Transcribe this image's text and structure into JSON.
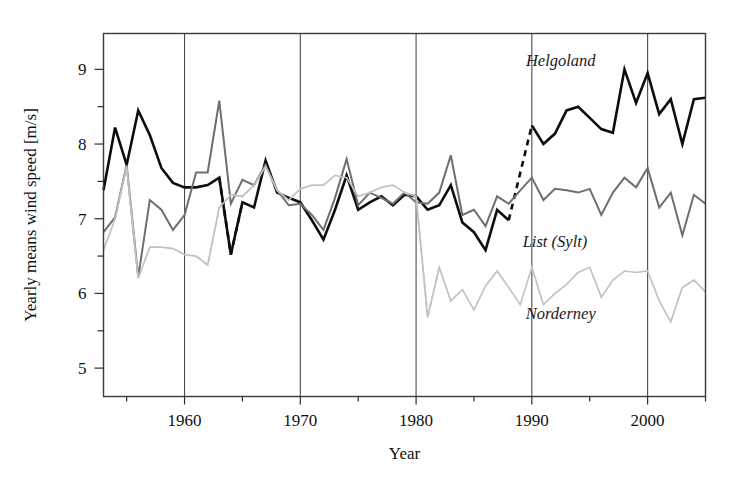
{
  "chart_data": {
    "type": "line",
    "title": "",
    "xlabel": "Year",
    "ylabel": "Yearly means wind speed [m/s]",
    "xlim": [
      1953,
      2005
    ],
    "ylim": [
      4.62,
      9.48
    ],
    "xticks": [
      1960,
      1970,
      1980,
      1990,
      2000
    ],
    "xtick_labels": [
      "1960",
      "1970",
      "1980",
      "1990",
      "2000"
    ],
    "xminor_ticks": [
      1955,
      1965,
      1975,
      1985,
      1995,
      2005
    ],
    "yticks": [
      5,
      6,
      7,
      8,
      9
    ],
    "ytick_labels": [
      "5",
      "6",
      "7",
      "8",
      "9"
    ],
    "yminor_ticks": [
      5.5,
      6.5,
      7.5,
      8.5
    ],
    "grid": "vertical-major-only",
    "legend": "inline-annotations",
    "annotations": [
      {
        "text": "Helgoland",
        "x": 1992.5,
        "y": 9.05,
        "name": "helgoland-label"
      },
      {
        "text": "List (Sylt)",
        "x": 1992.0,
        "y": 6.62,
        "name": "list-sylt-label"
      },
      {
        "text": "Norderney",
        "x": 1992.5,
        "y": 5.66,
        "name": "norderney-label"
      }
    ],
    "series": [
      {
        "name": "Helgoland",
        "color": "#0d0d0d",
        "width": 2.6,
        "x": [
          1953,
          1954,
          1955,
          1956,
          1957,
          1958,
          1959,
          1960,
          1961,
          1962,
          1963,
          1964,
          1965,
          1966,
          1967,
          1968,
          1969,
          1970,
          1971,
          1972,
          1973,
          1974,
          1975,
          1976,
          1977,
          1978,
          1979,
          1980,
          1981,
          1982,
          1983,
          1984,
          1985,
          1986,
          1987,
          1988,
          1990,
          1991,
          1992,
          1993,
          1994,
          1995,
          1996,
          1997,
          1998,
          1999,
          2000,
          2001,
          2002,
          2003,
          2004,
          2005
        ],
        "values": [
          7.38,
          8.22,
          7.72,
          8.45,
          8.12,
          7.68,
          7.48,
          7.42,
          7.42,
          7.45,
          7.55,
          6.52,
          7.22,
          7.15,
          7.78,
          7.35,
          7.28,
          7.22,
          6.98,
          6.72,
          7.12,
          7.58,
          7.12,
          7.22,
          7.3,
          7.18,
          7.32,
          7.3,
          7.12,
          7.18,
          7.45,
          6.95,
          6.82,
          6.58,
          7.12,
          6.98,
          8.25,
          8.0,
          8.14,
          8.45,
          8.5,
          8.35,
          8.2,
          8.15,
          9.0,
          8.55,
          8.95,
          8.4,
          8.6,
          8.0,
          8.6,
          8.62
        ],
        "gap_dashed_segment": {
          "from_year": 1988,
          "from_value": 6.98,
          "to_year": 1990,
          "to_value": 8.25
        },
        "dashed_segments": [
          {
            "x": [
              1963,
              1964,
              1965
            ],
            "values": [
              7.55,
              6.52,
              7.22
            ]
          }
        ]
      },
      {
        "name": "List (Sylt)",
        "color": "#6e6e6e",
        "width": 2.0,
        "x": [
          1953,
          1954,
          1955,
          1956,
          1957,
          1958,
          1959,
          1960,
          1961,
          1962,
          1963,
          1964,
          1965,
          1966,
          1967,
          1968,
          1969,
          1970,
          1971,
          1972,
          1973,
          1974,
          1975,
          1976,
          1977,
          1978,
          1979,
          1980,
          1981,
          1982,
          1983,
          1984,
          1985,
          1986,
          1987,
          1988,
          1989,
          1990,
          1991,
          1992,
          1993,
          1994,
          1995,
          1996,
          1997,
          1998,
          1999,
          2000,
          2001,
          2002,
          2003,
          2004,
          2005
        ],
        "values": [
          6.82,
          7.02,
          7.72,
          6.22,
          7.25,
          7.12,
          6.85,
          7.05,
          7.62,
          7.62,
          8.58,
          7.2,
          7.52,
          7.45,
          7.72,
          7.38,
          7.18,
          7.2,
          7.05,
          6.85,
          7.28,
          7.8,
          7.18,
          7.35,
          7.28,
          7.2,
          7.35,
          7.22,
          7.2,
          7.35,
          7.85,
          7.05,
          7.12,
          6.9,
          7.3,
          7.2,
          7.38,
          7.55,
          7.25,
          7.4,
          7.38,
          7.35,
          7.4,
          7.05,
          7.35,
          7.55,
          7.42,
          7.68,
          7.15,
          7.35,
          6.78,
          7.32,
          7.2
        ]
      },
      {
        "name": "Norderney",
        "color": "#c2c2c2",
        "width": 1.7,
        "x": [
          1953,
          1954,
          1955,
          1956,
          1957,
          1958,
          1959,
          1960,
          1961,
          1962,
          1963,
          1964,
          1965,
          1966,
          1967,
          1968,
          1969,
          1970,
          1971,
          1972,
          1973,
          1974,
          1975,
          1976,
          1977,
          1978,
          1979,
          1980,
          1981,
          1982,
          1983,
          1984,
          1985,
          1986,
          1987,
          1988,
          1989,
          1990,
          1991,
          1992,
          1993,
          1994,
          1995,
          1996,
          1997,
          1998,
          1999,
          2000,
          2001,
          2002,
          2003,
          2004,
          2005
        ],
        "values": [
          6.58,
          7.0,
          7.7,
          6.2,
          6.62,
          6.62,
          6.6,
          6.52,
          6.5,
          6.38,
          7.15,
          7.32,
          7.3,
          7.45,
          7.7,
          7.38,
          7.25,
          7.4,
          7.45,
          7.45,
          7.58,
          7.55,
          7.3,
          7.35,
          7.42,
          7.45,
          7.35,
          7.3,
          5.68,
          6.35,
          5.9,
          6.05,
          5.78,
          6.1,
          6.3,
          6.08,
          5.85,
          6.35,
          5.85,
          6.0,
          6.12,
          6.28,
          6.35,
          5.95,
          6.18,
          6.3,
          6.28,
          6.3,
          5.9,
          5.62,
          6.08,
          6.18,
          6.02
        ],
        "dashed_ranges": [
          [
            1961,
            1966
          ],
          [
            1979,
            1982
          ]
        ]
      }
    ]
  },
  "figure": {
    "background": "#ffffff",
    "frame_color": "#3a3a3a",
    "grid_color": "#4a4a4a"
  }
}
